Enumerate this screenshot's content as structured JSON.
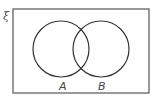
{
  "diagram": {
    "type": "venn",
    "universal_set": {
      "label": "ξ",
      "rect": {
        "x": 13,
        "y": 9,
        "width": 136,
        "height": 84
      },
      "stroke": "#555555"
    },
    "sets": [
      {
        "label": "A",
        "cx": 61,
        "cy": 49,
        "r": 28,
        "label_x": 59,
        "label_y": 90
      },
      {
        "label": "B",
        "cx": 101,
        "cy": 49,
        "r": 28,
        "label_x": 98,
        "label_y": 90
      }
    ],
    "stroke_color": "#333333"
  }
}
